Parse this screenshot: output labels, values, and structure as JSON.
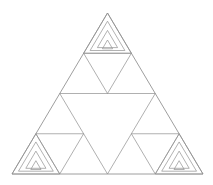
{
  "figure": {
    "type": "line-drawing",
    "background_color": "#ffffff",
    "stroke_color": "#8a8a8a",
    "stroke_width": 0.7,
    "canvas": {
      "width": 213,
      "height": 185
    },
    "geometry": {
      "outer_triangle": {
        "apex": [
          107.5,
          13
        ],
        "bottom_left": [
          12,
          174
        ],
        "bottom_right": [
          203,
          174
        ]
      },
      "edge_midpoints": {
        "left_edge_mid": [
          59.75,
          93.5
        ],
        "right_edge_mid": [
          155.25,
          93.5
        ],
        "bottom_edge_mid": [
          107.5,
          174
        ]
      },
      "subdivision_levels": 2,
      "nested_insets_per_corner": 3,
      "inset_ratios": [
        1.0,
        0.66,
        0.38,
        0.17
      ]
    },
    "corner_cells": [
      {
        "name": "top-corner-triangle",
        "apex": [
          107.5,
          13
        ],
        "bottom_left": [
          83.75,
          53.25
        ],
        "bottom_right": [
          131.25,
          53.25
        ]
      },
      {
        "name": "bottom-left-corner-triangle",
        "apex": [
          35.875,
          133.75
        ],
        "bottom_left": [
          12,
          174
        ],
        "bottom_right": [
          59.75,
          174
        ]
      },
      {
        "name": "bottom-right-corner-triangle",
        "apex": [
          179.125,
          133.75
        ],
        "bottom_left": [
          155.25,
          174
        ],
        "bottom_right": [
          203,
          174
        ]
      }
    ],
    "caption": ""
  }
}
